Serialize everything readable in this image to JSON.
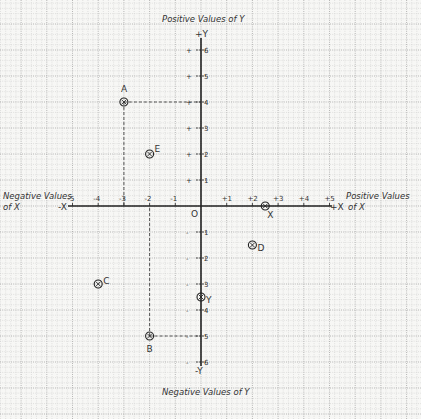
{
  "title_top": "Positive Values of Y",
  "title_bottom": "Negative Values of Y",
  "title_left_line1": "Negative Values",
  "title_left_line2": "of X",
  "title_right_line1": "Positive Values",
  "title_right_line2": "of X",
  "axis_labels": {
    "plus_y": "+Y",
    "minus_y": "-Y",
    "plus_x": "+X",
    "minus_x": "-X",
    "origin": "O"
  },
  "x_ticks": [
    {
      "value": -5,
      "label": "-5"
    },
    {
      "value": -4,
      "label": "-4"
    },
    {
      "value": -3,
      "label": "-3"
    },
    {
      "value": -2,
      "label": "-2"
    },
    {
      "value": -1,
      "label": "-1"
    },
    {
      "value": 1,
      "label": "+1"
    },
    {
      "value": 2,
      "label": "+2"
    },
    {
      "value": 3,
      "label": "+3"
    },
    {
      "value": 4,
      "label": "+4"
    },
    {
      "value": 5,
      "label": "+5"
    }
  ],
  "y_ticks": [
    {
      "value": 6,
      "label": "6"
    },
    {
      "value": 5,
      "label": "5"
    },
    {
      "value": 4,
      "label": "4"
    },
    {
      "value": 3,
      "label": "3"
    },
    {
      "value": 2,
      "label": "2"
    },
    {
      "value": 1,
      "label": "1"
    },
    {
      "value": -1,
      "label": "1"
    },
    {
      "value": -2,
      "label": "2"
    },
    {
      "value": -3,
      "label": "3"
    },
    {
      "value": -4,
      "label": "4"
    },
    {
      "value": -5,
      "label": "5"
    },
    {
      "value": -6,
      "label": "6"
    }
  ],
  "points": [
    {
      "name": "A",
      "x": -3,
      "y": 4,
      "label_dx": -3,
      "label_dy": -10,
      "dashed": true
    },
    {
      "name": "B",
      "x": -2,
      "y": -5,
      "label_dx": -3,
      "label_dy": 16,
      "dashed": true
    },
    {
      "name": "C",
      "x": -4,
      "y": -3,
      "label_dx": 5,
      "label_dy": 0
    },
    {
      "name": "D",
      "x": 2,
      "y": -1.5,
      "label_dx": 5,
      "label_dy": 6
    },
    {
      "name": "E",
      "x": -2,
      "y": 2,
      "label_dx": 5,
      "label_dy": -2
    },
    {
      "name": "X",
      "x": 2.5,
      "y": 0,
      "label_dx": 2,
      "label_dy": 12
    },
    {
      "name": "Y",
      "x": 0,
      "y": -3.5,
      "label_dx": 5,
      "label_dy": 6
    }
  ],
  "colors": {
    "paper": "#f7f7f5",
    "grid_minor": "#c8c8c8",
    "grid_major": "#9a9a9a",
    "axis": "#222222",
    "ink": "#333333"
  }
}
